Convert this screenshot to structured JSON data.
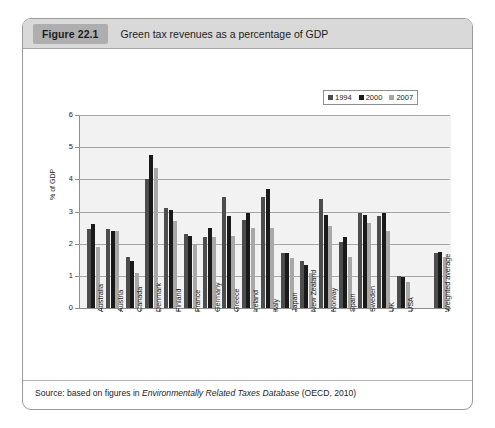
{
  "figure": {
    "tag": "Figure 22.1",
    "title": "Green tax revenues as a percentage of GDP",
    "source_prefix": "Source: based on figures in ",
    "source_italic": "Environmentally Related Taxes Database",
    "source_suffix": " (OECD, 2010)"
  },
  "colors": {
    "series_1994": "#4d4d4d",
    "series_2000": "#1a1a1a",
    "series_2007": "#a8a8a8",
    "plot_background": "#f2f2f2",
    "header_background": "#d9d9d9",
    "tag_background": "#aeaeae",
    "gridline": "#a6a6a6",
    "axis": "#8d8d8d",
    "box_border": "#9a9a9a"
  },
  "chart_data": {
    "type": "bar",
    "title": "Green tax revenues as a percentage of GDP",
    "xlabel": "",
    "ylabel": "% of GDP",
    "ylim": [
      0,
      6
    ],
    "yticks": [
      0,
      1,
      2,
      3,
      4,
      5,
      6
    ],
    "ytick_labels": [
      "0",
      "1",
      "2",
      "3",
      "4",
      "5",
      "6"
    ],
    "grid": true,
    "legend_position": "top-right",
    "categories": [
      "Australia",
      "Austria",
      "Canada",
      "Denmark",
      "Finland",
      "France",
      "Germany",
      "Greece",
      "Ireland",
      "Italy",
      "Japan",
      "New Zealand",
      "Norway",
      "Spain",
      "Sweden",
      "UK",
      "USA",
      "Weighted average"
    ],
    "series": [
      {
        "name": "1994",
        "color": "#4d4d4d",
        "values": [
          2.45,
          2.45,
          1.6,
          4.0,
          3.1,
          2.3,
          2.2,
          3.45,
          2.75,
          3.45,
          1.7,
          1.45,
          3.4,
          2.05,
          2.95,
          2.85,
          1.0,
          1.7
        ]
      },
      {
        "name": "2000",
        "color": "#1a1a1a",
        "values": [
          2.6,
          2.4,
          1.45,
          4.75,
          3.05,
          2.25,
          2.5,
          2.85,
          2.95,
          3.7,
          1.7,
          1.35,
          2.9,
          2.2,
          2.9,
          2.95,
          0.95,
          1.75
        ]
      },
      {
        "name": "2007",
        "color": "#a8a8a8",
        "values": [
          1.9,
          2.4,
          1.1,
          4.35,
          2.7,
          1.95,
          2.2,
          2.25,
          2.5,
          2.5,
          1.55,
          1.1,
          2.55,
          1.6,
          2.65,
          2.4,
          0.8,
          1.6
        ]
      }
    ],
    "legend": [
      "1994",
      "2000",
      "2007"
    ]
  }
}
